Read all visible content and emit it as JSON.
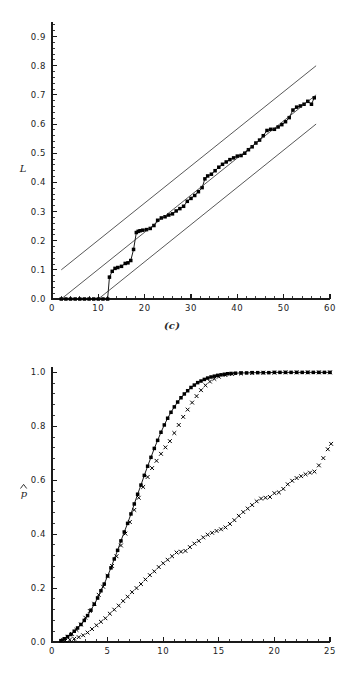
{
  "page": {
    "background_color": "#ffffff",
    "ink_color": "#000000",
    "width": 344,
    "height": 689
  },
  "panels": [
    {
      "id": "c",
      "caption": "(c)"
    },
    {
      "id": "d",
      "caption": "(d)"
    }
  ],
  "chart_data": [
    {
      "type": "scatter",
      "panel": "c",
      "title": "",
      "caption": "(c)",
      "xlabel": "",
      "ylabel": "L",
      "ylabel_glyph": "L",
      "xlim": [
        0,
        60
      ],
      "ylim": [
        0.0,
        0.95
      ],
      "grid": false,
      "legend": "none",
      "x_major_ticks": [
        0,
        10,
        20,
        30,
        40,
        50,
        60
      ],
      "x_tick_labels": [
        "0",
        "10",
        "20",
        "30",
        "40",
        "50",
        "60"
      ],
      "x_minor_step": 2,
      "y_major_ticks": [
        0.0,
        0.1,
        0.2,
        0.3,
        0.4,
        0.5,
        0.6,
        0.7,
        0.8,
        0.9
      ],
      "y_tick_labels": [
        "0.0",
        "0.1",
        "0.2",
        "0.3",
        "0.4",
        "0.5",
        "0.6",
        "0.7",
        "0.8",
        "0.9"
      ],
      "y_minor_per_major": 5,
      "series": [
        {
          "name": "empirical-curve",
          "marker": "filled-square",
          "line": true,
          "x": [
            2,
            3,
            4,
            5,
            6,
            7,
            8,
            9,
            10,
            11,
            12,
            12.4,
            13,
            13.6,
            14.2,
            15,
            15.8,
            16.4,
            17,
            17.6,
            18.2,
            18.6,
            19,
            19.6,
            20.4,
            21.2,
            22,
            22.8,
            23.6,
            24.4,
            25.2,
            26,
            26.8,
            27.6,
            28.4,
            29.2,
            30,
            30.8,
            31.6,
            32.4,
            33,
            33.6,
            34.4,
            35.2,
            36,
            36.8,
            37.6,
            38.4,
            39.2,
            40,
            40.8,
            41.6,
            42.4,
            43.2,
            44,
            44.8,
            45.6,
            46.4,
            47.2,
            48,
            48.8,
            49.6,
            50.4,
            51.2,
            52,
            52.8,
            53.6,
            54.4,
            55.2,
            56,
            56.6
          ],
          "y": [
            0.0,
            0.0,
            0.0,
            0.0,
            0.0,
            0.0,
            0.0,
            0.0,
            0.0,
            0.0,
            0.0,
            0.075,
            0.095,
            0.105,
            0.108,
            0.112,
            0.122,
            0.124,
            0.132,
            0.17,
            0.228,
            0.232,
            0.234,
            0.236,
            0.238,
            0.242,
            0.252,
            0.27,
            0.278,
            0.282,
            0.288,
            0.292,
            0.302,
            0.31,
            0.318,
            0.335,
            0.345,
            0.355,
            0.368,
            0.382,
            0.412,
            0.422,
            0.428,
            0.44,
            0.452,
            0.462,
            0.47,
            0.478,
            0.484,
            0.49,
            0.492,
            0.5,
            0.512,
            0.522,
            0.535,
            0.545,
            0.56,
            0.578,
            0.582,
            0.582,
            0.59,
            0.598,
            0.608,
            0.622,
            0.648,
            0.658,
            0.662,
            0.668,
            0.678,
            0.668,
            0.69
          ]
        },
        {
          "name": "reference-line-upper",
          "marker": "none",
          "line": true,
          "x": [
            2,
            57
          ],
          "y": [
            0.1,
            0.8
          ]
        },
        {
          "name": "reference-line-middle",
          "marker": "none",
          "line": true,
          "x": [
            2,
            57
          ],
          "y": [
            0.0,
            0.7
          ]
        },
        {
          "name": "reference-line-lower",
          "marker": "none",
          "line": true,
          "x": [
            10,
            57
          ],
          "y": [
            0.0,
            0.6
          ]
        }
      ]
    },
    {
      "type": "scatter",
      "panel": "d",
      "title": "",
      "caption": "(d)",
      "xlabel": "",
      "ylabel": "p̂",
      "ylabel_glyph": "p-hat",
      "xlim": [
        0,
        25
      ],
      "ylim": [
        0.0,
        1.02
      ],
      "grid": false,
      "legend": "none",
      "x_major_ticks": [
        0,
        5,
        10,
        15,
        20,
        25
      ],
      "x_tick_labels": [
        "0",
        "5",
        "10",
        "15",
        "20",
        "25"
      ],
      "x_minor_step": 1,
      "y_major_ticks": [
        0.0,
        0.2,
        0.4,
        0.6,
        0.8,
        1.0
      ],
      "y_tick_labels": [
        "0.0",
        "0.2",
        "0.4",
        "0.6",
        "0.8",
        "1.0"
      ],
      "y_minor_per_major": 5,
      "series": [
        {
          "name": "fitted-sigmoid-with-squares",
          "marker": "filled-square",
          "line": true,
          "x": [
            0.8,
            1.1,
            1.4,
            1.7,
            2.0,
            2.3,
            2.6,
            2.9,
            3.2,
            3.5,
            3.8,
            4.1,
            4.4,
            4.7,
            5.0,
            5.3,
            5.6,
            5.9,
            6.2,
            6.5,
            6.8,
            7.1,
            7.4,
            7.7,
            8.0,
            8.3,
            8.6,
            8.9,
            9.2,
            9.5,
            9.8,
            10.1,
            10.4,
            10.7,
            11.0,
            11.3,
            11.6,
            11.9,
            12.2,
            12.5,
            12.8,
            13.1,
            13.4,
            13.7,
            14.0,
            14.3,
            14.6,
            14.9,
            15.2,
            15.5,
            15.8,
            16.1,
            16.5,
            17.0,
            17.5,
            18.0,
            18.5,
            19.0,
            19.5,
            20.0,
            20.5,
            21.0,
            21.5,
            22.0,
            22.5,
            23.0,
            23.5,
            24.0,
            24.5,
            25.0
          ],
          "y": [
            0.005,
            0.012,
            0.02,
            0.028,
            0.04,
            0.052,
            0.065,
            0.08,
            0.098,
            0.118,
            0.14,
            0.163,
            0.19,
            0.215,
            0.245,
            0.275,
            0.308,
            0.34,
            0.375,
            0.408,
            0.44,
            0.475,
            0.512,
            0.548,
            0.582,
            0.618,
            0.652,
            0.685,
            0.718,
            0.748,
            0.778,
            0.805,
            0.83,
            0.852,
            0.872,
            0.89,
            0.906,
            0.92,
            0.932,
            0.944,
            0.953,
            0.962,
            0.968,
            0.974,
            0.979,
            0.983,
            0.986,
            0.989,
            0.991,
            0.993,
            0.995,
            0.996,
            0.997,
            0.998,
            0.998,
            0.999,
            0.999,
            0.999,
            0.999,
            1.0,
            1.0,
            1.0,
            1.0,
            1.0,
            1.0,
            1.0,
            1.0,
            1.0,
            1.0,
            1.0
          ]
        },
        {
          "name": "observed-x-markers-upper",
          "marker": "x",
          "line": false,
          "x": [
            1.0,
            1.4,
            1.8,
            2.2,
            2.6,
            3.0,
            3.4,
            3.8,
            4.2,
            4.6,
            5.0,
            5.4,
            5.8,
            6.2,
            6.6,
            7.0,
            7.4,
            7.8,
            8.2,
            8.6,
            9.0,
            9.4,
            9.8,
            10.2,
            10.6,
            11.0,
            11.4,
            11.8,
            12.2,
            12.6,
            13.0,
            13.4,
            13.8,
            14.2,
            14.6,
            15.0,
            15.6,
            16.2,
            17.0,
            18.0,
            19.0,
            20.0,
            21.0,
            22.0,
            23.0,
            24.0,
            25.0
          ],
          "y": [
            0.008,
            0.018,
            0.03,
            0.045,
            0.065,
            0.09,
            0.115,
            0.142,
            0.175,
            0.205,
            0.245,
            0.282,
            0.318,
            0.358,
            0.402,
            0.445,
            0.49,
            0.535,
            0.575,
            0.612,
            0.645,
            0.672,
            0.698,
            0.722,
            0.745,
            0.775,
            0.805,
            0.835,
            0.862,
            0.888,
            0.912,
            0.934,
            0.952,
            0.966,
            0.976,
            0.984,
            0.99,
            0.994,
            0.996,
            0.998,
            0.999,
            0.999,
            1.0,
            1.0,
            1.0,
            1.0,
            1.0
          ]
        },
        {
          "name": "observed-x-markers-lower",
          "marker": "x",
          "line": false,
          "x": [
            1.2,
            1.6,
            2.0,
            2.4,
            2.8,
            3.2,
            3.6,
            4.0,
            4.4,
            4.8,
            5.2,
            5.6,
            6.0,
            6.4,
            6.8,
            7.2,
            7.6,
            8.0,
            8.4,
            8.8,
            9.2,
            9.6,
            10.0,
            10.4,
            10.8,
            11.2,
            11.6,
            12.0,
            12.4,
            12.8,
            13.2,
            13.6,
            14.0,
            14.4,
            14.8,
            15.2,
            15.6,
            16.0,
            16.4,
            16.8,
            17.2,
            17.6,
            18.0,
            18.4,
            18.8,
            19.2,
            19.6,
            20.0,
            20.4,
            20.8,
            21.2,
            21.6,
            22.0,
            22.4,
            22.8,
            23.2,
            23.6,
            24.0,
            24.4,
            24.8,
            25.1
          ],
          "y": [
            0.005,
            0.008,
            0.012,
            0.018,
            0.025,
            0.035,
            0.048,
            0.062,
            0.075,
            0.088,
            0.105,
            0.12,
            0.135,
            0.152,
            0.168,
            0.185,
            0.2,
            0.215,
            0.232,
            0.248,
            0.262,
            0.278,
            0.292,
            0.305,
            0.318,
            0.332,
            0.335,
            0.338,
            0.352,
            0.365,
            0.375,
            0.388,
            0.398,
            0.405,
            0.412,
            0.418,
            0.425,
            0.438,
            0.452,
            0.468,
            0.482,
            0.495,
            0.508,
            0.522,
            0.532,
            0.535,
            0.538,
            0.552,
            0.555,
            0.568,
            0.585,
            0.598,
            0.608,
            0.615,
            0.622,
            0.628,
            0.632,
            0.655,
            0.682,
            0.715,
            0.735
          ]
        }
      ]
    }
  ]
}
